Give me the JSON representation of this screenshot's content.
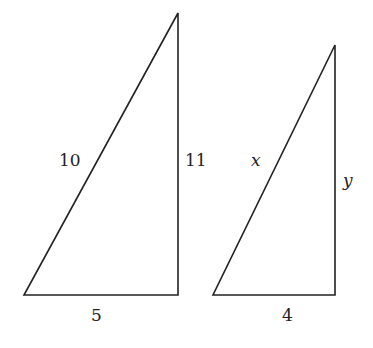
{
  "diagram": {
    "stroke_color": "#222222",
    "triangles": [
      {
        "name": "left-triangle",
        "vertices": [
          [
            24,
            295
          ],
          [
            178,
            295
          ],
          [
            178,
            13
          ]
        ],
        "labels": {
          "hypotenuse": "10",
          "vertical_leg": "11",
          "base": "5"
        }
      },
      {
        "name": "right-triangle",
        "vertices": [
          [
            213,
            295
          ],
          [
            335,
            295
          ],
          [
            335,
            45
          ]
        ],
        "labels": {
          "hypotenuse": "x",
          "vertical_leg": "y",
          "base": "4"
        }
      }
    ]
  }
}
